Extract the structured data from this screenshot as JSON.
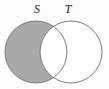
{
  "figure": {
    "type": "venn-diagram",
    "title": "",
    "canvas": {
      "width": 109,
      "height": 89,
      "background_color": "#fdfdfd"
    },
    "colors": {
      "shaded_fill": "#a9a9a9",
      "unshaded_fill": "#ffffff",
      "stroke": "#7a7a7a",
      "label_color": "#1a1a1a"
    },
    "stroke_width": 1,
    "sets": [
      {
        "id": "S",
        "label": "S",
        "label_x": 37,
        "label_y": 13,
        "center_x": 36,
        "center_y": 52,
        "radius": 31,
        "fill": "#a9a9a9",
        "shaded": true
      },
      {
        "id": "T",
        "label": "T",
        "label_x": 68,
        "label_y": 13,
        "center_x": 71,
        "center_y": 52,
        "radius": 31,
        "fill": "#ffffff",
        "shaded": false
      }
    ],
    "regions": [
      {
        "id": "S-only",
        "name": "S minus T",
        "shaded": true,
        "fill": "#a9a9a9"
      },
      {
        "id": "S-and-T",
        "name": "S intersect T",
        "shaded": false,
        "fill": "#ffffff"
      },
      {
        "id": "T-only",
        "name": "T minus S",
        "shaded": false,
        "fill": "#ffffff"
      }
    ]
  }
}
